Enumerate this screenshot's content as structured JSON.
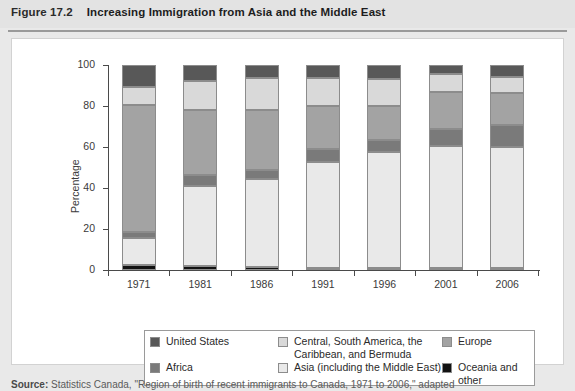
{
  "header": {
    "figure_number": "Figure 17.2",
    "title": "Increasing Immigration from Asia and the Middle East"
  },
  "source": {
    "prefix": "Source:",
    "text": "Statistics Canada, \"Region of birth of recent immigrants to Canada, 1971 to 2006,\" adapted"
  },
  "axes": {
    "y_label": "Percentage",
    "y_ticks": [
      "0",
      "20",
      "40",
      "60",
      "80",
      "100"
    ],
    "x_ticks": [
      "1971",
      "1981",
      "1986",
      "1991",
      "1996",
      "2001",
      "2006"
    ]
  },
  "legend": {
    "items": [
      {
        "label": "United States",
        "color": "#585858",
        "key": "united-states"
      },
      {
        "label": "Central, South America, the Caribbean, and Bermuda",
        "color": "#d9d9d9",
        "key": "central-south-america"
      },
      {
        "label": "Europe",
        "color": "#a3a3a3",
        "key": "europe"
      },
      {
        "label": "Africa",
        "color": "#7a7a7a",
        "key": "africa"
      },
      {
        "label": "Asia (including the Middle East)",
        "color": "#e9e9e9",
        "key": "asia"
      },
      {
        "label": "Oceania and other",
        "color": "#121212",
        "key": "oceania"
      }
    ]
  },
  "chart_data": {
    "type": "bar",
    "stacked": true,
    "title": "Increasing Immigration from Asia and the Middle East",
    "xlabel": "",
    "ylabel": "Percentage",
    "ylim": [
      0,
      100
    ],
    "grid": false,
    "legend_position": "bottom",
    "categories": [
      "1971",
      "1981",
      "1986",
      "1991",
      "1996",
      "2001",
      "2006"
    ],
    "series": [
      {
        "name": "Oceania and other",
        "color": "#121212",
        "values": [
          2.5,
          2.0,
          1.5,
          1.0,
          1.0,
          1.0,
          1.0
        ]
      },
      {
        "name": "Asia (including the Middle East)",
        "color": "#e9e9e9",
        "values": [
          13.0,
          39.0,
          43.0,
          51.5,
          56.5,
          59.5,
          59.0
        ]
      },
      {
        "name": "Africa",
        "color": "#7a7a7a",
        "values": [
          3.0,
          5.5,
          4.5,
          6.5,
          6.0,
          8.5,
          10.5
        ]
      },
      {
        "name": "Europe",
        "color": "#a3a3a3",
        "values": [
          62.0,
          31.5,
          29.0,
          21.0,
          16.5,
          18.0,
          16.0
        ]
      },
      {
        "name": "Central, South America, the Caribbean, and Bermuda",
        "color": "#d9d9d9",
        "values": [
          9.0,
          14.0,
          15.5,
          13.5,
          13.0,
          8.5,
          7.5
        ]
      },
      {
        "name": "United States",
        "color": "#585858",
        "values": [
          10.5,
          8.0,
          6.5,
          6.5,
          7.0,
          4.5,
          6.0
        ]
      }
    ]
  }
}
